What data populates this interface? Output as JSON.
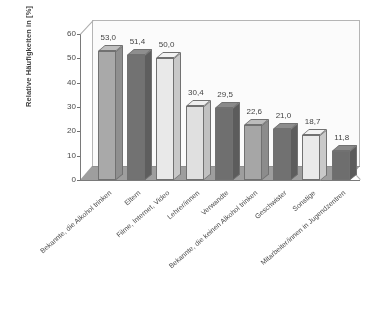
{
  "chart_data": {
    "type": "bar",
    "title": "",
    "subtitle": "",
    "xlabel": "",
    "ylabel": "Relative Häufigkeiten in [%]",
    "ylim": [
      0,
      60
    ],
    "ytick_labels": [
      "0",
      "10",
      "20",
      "30",
      "40",
      "50",
      "60"
    ],
    "ytick_values": [
      0,
      10,
      20,
      30,
      40,
      50,
      60
    ],
    "grid": false,
    "legend": "none",
    "style": "3d-bar",
    "categories": [
      "Bekannte, die Alkohol trinken",
      "Eltern",
      "Filme, Internet, Video",
      "Lehrer/innen",
      "Verwandte",
      "Bekannte, die keinen Alkohol trinken",
      "Geschwister",
      "Sonstige",
      "Mitarbeiter/innen in Jugendzentren"
    ],
    "values": [
      53.0,
      51.4,
      50.0,
      30.4,
      29.5,
      22.6,
      21.0,
      18.7,
      11.8
    ],
    "value_labels": [
      "53,0",
      "51,4",
      "50,0",
      "30,4",
      "29,5",
      "22,6",
      "21,0",
      "18,7",
      "11,8"
    ],
    "bar_colors": [
      "#a9a9a9",
      "#6f6f6f",
      "#ececec",
      "#e3e3e3",
      "#6b6b6b",
      "#a5a5a5",
      "#6d6d6d",
      "#ededed",
      "#6a6a6a"
    ],
    "bar_side_colors": [
      "#8d8d8d",
      "#5a5a5a",
      "#c9c9c9",
      "#c2c2c2",
      "#575757",
      "#8a8a8a",
      "#585858",
      "#cacaca",
      "#565656"
    ],
    "bar_top_colors": [
      "#c0c0c0",
      "#8c8c8c",
      "#f7f7f7",
      "#f2f2f2",
      "#888888",
      "#bdbdbd",
      "#8a8a8a",
      "#f6f6f6",
      "#868686"
    ]
  },
  "colors": {
    "background": "#ffffff",
    "axis": "#777777",
    "frame": "#b5b5b5",
    "floor": "#9d9d9d",
    "text": "#3b3b3b"
  }
}
